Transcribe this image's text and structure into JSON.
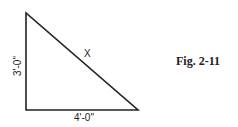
{
  "diagram": {
    "type": "right-triangle",
    "vertical_side_label": "3'-0\"",
    "horizontal_side_label": "4'-0\"",
    "hypotenuse_label": "X",
    "stroke_color": "#222222"
  },
  "caption": "Fig. 2-11"
}
